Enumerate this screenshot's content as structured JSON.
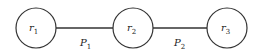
{
  "diagram": {
    "nodes": [
      {
        "id": "r1",
        "label": "r",
        "sub": "1",
        "cx": 36,
        "cy": 28,
        "r": 20
      },
      {
        "id": "r2",
        "label": "r",
        "sub": "2",
        "cx": 133,
        "cy": 28,
        "r": 20
      },
      {
        "id": "r3",
        "label": "r",
        "sub": "3",
        "cx": 227,
        "cy": 28,
        "r": 20
      }
    ],
    "edges": [
      {
        "from": "r1",
        "to": "r2",
        "label": "P",
        "sub": "1"
      },
      {
        "from": "r2",
        "to": "r3",
        "label": "P",
        "sub": "2"
      }
    ],
    "stroke_color": "#333333"
  }
}
